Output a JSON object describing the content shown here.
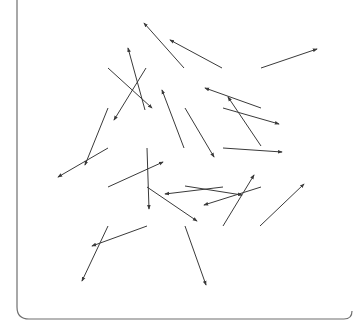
{
  "diagram": {
    "type": "random-arrow-field",
    "frame": {
      "left_x": 17,
      "bottom_y": 319,
      "right_x": 352,
      "corner_radius": 12,
      "color": "#6f6f6f"
    },
    "line_color": "#3a3a3a",
    "arrows": [
      {
        "x1": 184,
        "y1": 68,
        "x2": 144,
        "y2": 23
      },
      {
        "x1": 222,
        "y1": 68,
        "x2": 170,
        "y2": 40
      },
      {
        "x1": 261,
        "y1": 68,
        "x2": 317,
        "y2": 49
      },
      {
        "x1": 108,
        "y1": 68,
        "x2": 152,
        "y2": 108
      },
      {
        "x1": 145,
        "y1": 110,
        "x2": 128,
        "y2": 48
      },
      {
        "x1": 146,
        "y1": 68,
        "x2": 114,
        "y2": 120
      },
      {
        "x1": 184,
        "y1": 148,
        "x2": 162,
        "y2": 90
      },
      {
        "x1": 185,
        "y1": 108,
        "x2": 214,
        "y2": 157
      },
      {
        "x1": 261,
        "y1": 108,
        "x2": 205,
        "y2": 88
      },
      {
        "x1": 223,
        "y1": 108,
        "x2": 279,
        "y2": 124
      },
      {
        "x1": 261,
        "y1": 146,
        "x2": 228,
        "y2": 97
      },
      {
        "x1": 223,
        "y1": 148,
        "x2": 282,
        "y2": 152
      },
      {
        "x1": 108,
        "y1": 108,
        "x2": 85,
        "y2": 165
      },
      {
        "x1": 108,
        "y1": 148,
        "x2": 58,
        "y2": 177
      },
      {
        "x1": 147,
        "y1": 148,
        "x2": 149,
        "y2": 209
      },
      {
        "x1": 108,
        "y1": 187,
        "x2": 163,
        "y2": 162
      },
      {
        "x1": 147,
        "y1": 187,
        "x2": 197,
        "y2": 221
      },
      {
        "x1": 223,
        "y1": 187,
        "x2": 165,
        "y2": 194
      },
      {
        "x1": 185,
        "y1": 186,
        "x2": 242,
        "y2": 195
      },
      {
        "x1": 261,
        "y1": 187,
        "x2": 204,
        "y2": 205
      },
      {
        "x1": 223,
        "y1": 226,
        "x2": 254,
        "y2": 175
      },
      {
        "x1": 260,
        "y1": 226,
        "x2": 304,
        "y2": 184
      },
      {
        "x1": 147,
        "y1": 226,
        "x2": 92,
        "y2": 246
      },
      {
        "x1": 108,
        "y1": 226,
        "x2": 82,
        "y2": 281
      },
      {
        "x1": 185,
        "y1": 226,
        "x2": 206,
        "y2": 285
      }
    ]
  }
}
